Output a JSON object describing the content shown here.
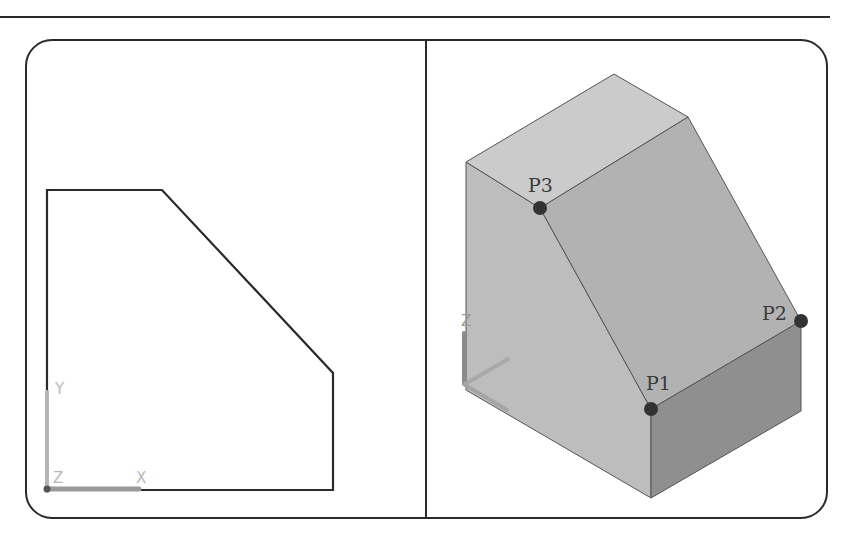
{
  "figure": {
    "colors": {
      "line": "#2a2a2a",
      "face_top": "#c9c9c9",
      "face_left": "#bdbdbd",
      "face_slope": "#b0b0b0",
      "face_front": "#8e8e8e",
      "point_marker": "#333333",
      "ucs": "#a8a8a8"
    }
  },
  "left_viewport": {
    "ucs_icon": {
      "x_label": "X",
      "y_label": "Y",
      "z_label": "Z"
    }
  },
  "right_viewport": {
    "ucs_icon": {
      "x_label": "X",
      "z_label": "Z"
    },
    "points": [
      {
        "id": "p1",
        "label": "P1"
      },
      {
        "id": "p2",
        "label": "P2"
      },
      {
        "id": "p3",
        "label": "P3"
      }
    ]
  }
}
